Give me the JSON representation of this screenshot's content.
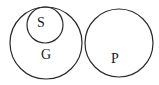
{
  "diagram": {
    "type": "euler-diagram",
    "stroke_color": "#2a2a2a",
    "background": "#ffffff",
    "sets": [
      {
        "id": "G",
        "label": "G",
        "cx": 46,
        "cy": 43,
        "r": 36,
        "label_x": 46,
        "label_y": 56
      },
      {
        "id": "S",
        "label": "S",
        "cx": 45,
        "cy": 25,
        "r": 18,
        "label_x": 41,
        "label_y": 24,
        "contained_in": "G"
      },
      {
        "id": "P",
        "label": "P",
        "cx": 119,
        "cy": 43,
        "r": 34,
        "label_x": 115,
        "label_y": 60
      }
    ],
    "relations": [
      "S is a subset of G",
      "P is disjoint from G (and S)"
    ]
  }
}
